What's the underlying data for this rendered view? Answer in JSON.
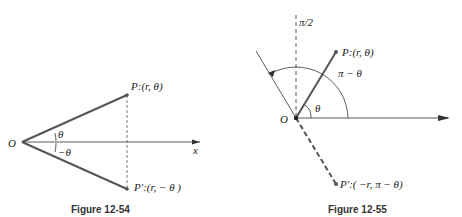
{
  "figures": [
    {
      "caption": "Figure 12-54",
      "origin_label": "O",
      "axis_label": "x",
      "point_p": "P:(r, θ)",
      "point_p_prime": "P′:(r, − θ )",
      "angle_pos": "θ",
      "angle_neg": "−θ"
    },
    {
      "caption": "Figure 12-55",
      "origin_label": "O",
      "vertical_label": "π/2",
      "point_p": "P:(r, θ)",
      "point_p_prime": "P′:( −r, π − θ)",
      "angle_theta": "θ",
      "angle_pi_minus": "π − θ"
    }
  ],
  "colors": {
    "line": "#555555",
    "thin": "#333333"
  }
}
